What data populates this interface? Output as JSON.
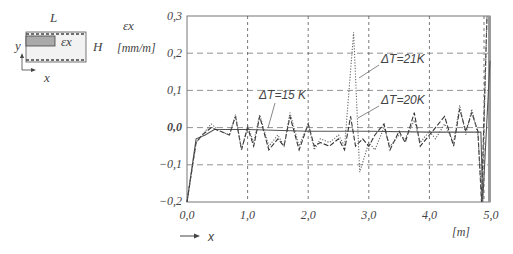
{
  "chart_data": {
    "type": "line",
    "title": "",
    "xlabel": "x",
    "xunit": "[m]",
    "ylabel": "εx",
    "yunit": "[mm/m]",
    "xlim": [
      0.0,
      5.0
    ],
    "ylim": [
      -0.2,
      0.3
    ],
    "x_ticks": [
      "0,0",
      "1,0",
      "2,0",
      "3,0",
      "4,0",
      "5,0"
    ],
    "y_ticks": [
      "0,3",
      "0,2",
      "0,1",
      "0,0",
      "−0,1",
      "−0,2"
    ],
    "grid": "dashed",
    "annotations": [
      "ΔT=15 K",
      "ΔT=21K",
      "ΔT=20K"
    ],
    "series": [
      {
        "name": "ΔT=15 K",
        "style": "solid",
        "x": [
          0.0,
          0.15,
          0.3,
          0.45,
          1.0,
          2.0,
          3.0,
          4.0,
          4.85,
          4.88,
          5.0
        ],
        "values": [
          -0.2,
          -0.03,
          -0.02,
          -0.005,
          -0.005,
          -0.01,
          -0.01,
          -0.012,
          -0.012,
          -0.2,
          0.18
        ]
      },
      {
        "name": "ΔT=20K",
        "style": "dashed",
        "x": [
          0.0,
          0.15,
          0.25,
          0.4,
          0.55,
          0.7,
          0.8,
          0.9,
          1.0,
          1.1,
          1.2,
          1.35,
          1.5,
          1.6,
          1.7,
          1.85,
          2.0,
          2.1,
          2.2,
          2.35,
          2.5,
          2.6,
          2.7,
          2.78,
          2.9,
          3.0,
          3.1,
          3.25,
          3.35,
          3.5,
          3.6,
          3.75,
          3.85,
          4.0,
          4.1,
          4.25,
          4.4,
          4.5,
          4.6,
          4.7,
          4.8,
          4.86,
          4.95
        ],
        "values": [
          -0.2,
          -0.04,
          -0.02,
          0.0,
          -0.01,
          -0.02,
          0.03,
          -0.06,
          0.0,
          -0.05,
          0.03,
          -0.06,
          -0.03,
          -0.05,
          0.03,
          -0.06,
          0.01,
          -0.05,
          -0.04,
          -0.05,
          -0.03,
          -0.06,
          0.03,
          -0.05,
          -0.03,
          -0.05,
          -0.02,
          0.01,
          -0.06,
          -0.01,
          -0.04,
          0.04,
          -0.05,
          -0.02,
          0.0,
          0.03,
          -0.05,
          0.05,
          -0.01,
          0.04,
          -0.01,
          -0.2,
          0.3
        ]
      },
      {
        "name": "ΔT=21K",
        "style": "dotted",
        "x": [
          0.0,
          0.15,
          0.25,
          0.4,
          0.55,
          0.7,
          0.8,
          0.9,
          1.0,
          1.1,
          1.2,
          1.35,
          1.5,
          1.6,
          1.7,
          1.85,
          2.0,
          2.1,
          2.2,
          2.35,
          2.5,
          2.6,
          2.75,
          2.85,
          3.0,
          3.1,
          3.25,
          3.35,
          3.5,
          3.6,
          3.75,
          3.85,
          4.0,
          4.1,
          4.25,
          4.4,
          4.5,
          4.6,
          4.7,
          4.8,
          4.87,
          4.95
        ],
        "values": [
          -0.2,
          -0.04,
          -0.02,
          0.01,
          -0.01,
          -0.02,
          0.035,
          -0.06,
          0.005,
          -0.04,
          0.035,
          -0.05,
          -0.02,
          -0.05,
          0.04,
          -0.05,
          0.01,
          -0.06,
          -0.03,
          -0.04,
          -0.02,
          -0.05,
          0.256,
          -0.12,
          -0.04,
          -0.06,
          0.0,
          -0.05,
          -0.02,
          -0.03,
          0.02,
          -0.04,
          -0.01,
          -0.03,
          0.01,
          -0.04,
          0.06,
          -0.02,
          0.05,
          -0.02,
          -0.2,
          0.3
        ]
      }
    ]
  },
  "inset": {
    "length_label": "L",
    "height_label": "H",
    "strain_label": "εx",
    "x_axis_label": "x",
    "y_axis_label": "y"
  },
  "axis": {
    "y_symbol": "εx",
    "y_unit": "[mm/m]",
    "x_symbol": "x",
    "x_unit": "[m]"
  }
}
